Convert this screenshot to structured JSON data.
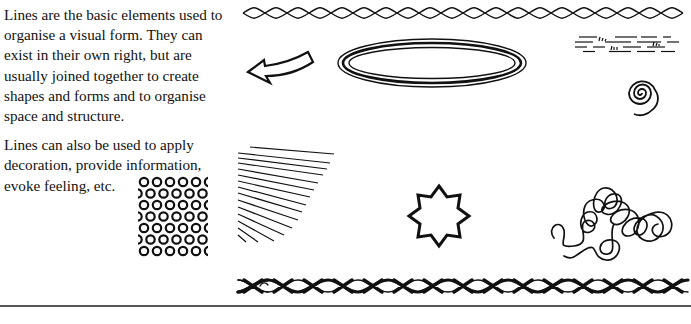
{
  "body_text": {
    "paragraph_1": "Lines are the basic elements used to organise a visual form. They can exist in their own right, but are usually joined together to create shapes and forms and to organise space and structure.",
    "paragraph_2": "Lines can also be used to apply decoration, provide information, evoke feeling, etc."
  },
  "illustrations": [
    {
      "name": "twisted-rope-line",
      "description": "Twisted wavy rope border along top"
    },
    {
      "name": "curved-arrow",
      "description": "Outlined curved arrow pointing left"
    },
    {
      "name": "concentric-ellipses",
      "description": "Three nested elongated ellipse outlines"
    },
    {
      "name": "dashed-water-lines",
      "description": "Dashed horizontal lines with small grass marks"
    },
    {
      "name": "spiral",
      "description": "Hand-drawn spiral"
    },
    {
      "name": "parallel-lines-block",
      "description": "Block of closely spaced horizontal lines"
    },
    {
      "name": "fanned-lines",
      "description": "Diagonal lines fanning out"
    },
    {
      "name": "circle-pattern",
      "description": "Grid of small offset circles"
    },
    {
      "name": "eight-point-star",
      "description": "Outlined eight-pointed star"
    },
    {
      "name": "scribble-loops",
      "description": "Tangled looping scribble line"
    },
    {
      "name": "braided-border",
      "description": "Ornamental braided X-pattern border along bottom"
    }
  ],
  "colors": {
    "ink": "#111111",
    "background": "#ffffff",
    "rule": "#555555"
  }
}
